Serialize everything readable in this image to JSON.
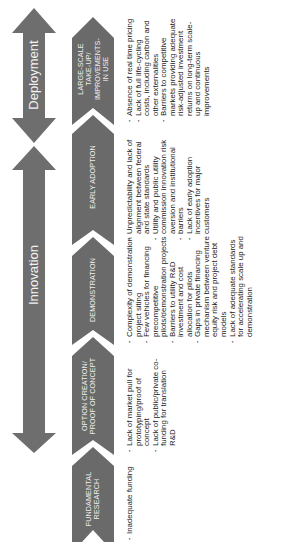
{
  "colors": {
    "arrow_fill": "#6e6e6e",
    "chevron_fill": "#6a6a6a",
    "text": "#222222",
    "background": "#ffffff"
  },
  "phases": {
    "deployment": {
      "label": "Deployment",
      "icon": "double-headed-arrow"
    },
    "innovation": {
      "label": "Innovation",
      "icon": "double-headed-arrow"
    }
  },
  "stages": [
    {
      "id": "large-scale",
      "label": "LARGE-SCALE TAKE-UP/ IMPROVEMENTS- IN USE",
      "barriers": [
        "Absence of real time pricing",
        "Lack of full life-cycling costs, including carbon and other externalities",
        "Barriers to competitive markets providing adequate risk-adjusted investment returns on long-term scale-up and continuous improvements"
      ]
    },
    {
      "id": "early-adoption",
      "label": "EARLY ADOPTION",
      "barriers": [
        "Unpredictability and lack of alignment between federal and state standards",
        "Utility and public utility commission innovation risk aversion and institutional",
        "barriers",
        "Lack of early adoption incentives for major customers"
      ]
    },
    {
      "id": "demonstration",
      "label": "DEMONSTRATION",
      "barriers": [
        "Complexity of demonstration project siting",
        "Few vehicles for financing precompetitive pilots/demonstration projects",
        "Barriers to utility R&D investment and cost allocation for pilots",
        "Gaps in private financing mechanism between venture equity risk and project debt models",
        "Lack of adequate standards for accelerating scale up and demonstration"
      ]
    },
    {
      "id": "option-creation",
      "label": "OPTION CREATION/ PROOF OF CONCEPT",
      "barriers": [
        "Lack of market pull for prototyping/proof of concept",
        "Lack of public/private co-funding for translation R&D"
      ]
    },
    {
      "id": "fundamental-research",
      "label": "FUNDAMENTAL RESEARCH",
      "barriers": [
        "Inadequate funding"
      ]
    }
  ]
}
